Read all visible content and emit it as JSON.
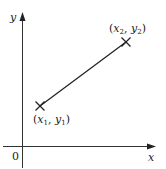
{
  "diagram": {
    "title": "",
    "axes": {
      "x_label": "x",
      "y_label": "y",
      "origin_label": "0"
    },
    "points": [
      {
        "name": "p1",
        "label_pre": "(",
        "var_x": "x",
        "sub_x": "1",
        "sep": ", ",
        "var_y": "y",
        "sub_y": "1",
        "label_post": ")"
      },
      {
        "name": "p2",
        "label_pre": "(",
        "var_x": "x",
        "sub_x": "2",
        "sep": ", ",
        "var_y": "y",
        "sub_y": "2",
        "label_post": ")"
      }
    ],
    "segment": {
      "from": "p1",
      "to": "p2"
    },
    "colors": {
      "line": "#222222",
      "axis": "#333333",
      "text": "#222222"
    }
  }
}
